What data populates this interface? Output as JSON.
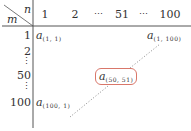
{
  "table": {
    "corner": {
      "row_var": "m",
      "col_var": "n"
    },
    "columns": [
      "1",
      "2",
      "⋯",
      "51",
      "⋯",
      "100"
    ],
    "rows": [
      "1",
      "2",
      "⋮",
      "50",
      "⋮",
      "100"
    ],
    "cells": {
      "top_left": {
        "base": "a",
        "sub": "(1, 1)"
      },
      "top_right": {
        "base": "a",
        "sub": "(1, 100)"
      },
      "center": {
        "base": "a",
        "sub": "(50, 51)"
      },
      "bottom_left": {
        "base": "a",
        "sub": "(100, 1)"
      }
    },
    "colors": {
      "line": "#555555",
      "dotted": "#888888",
      "highlight": "#d9776a"
    }
  }
}
